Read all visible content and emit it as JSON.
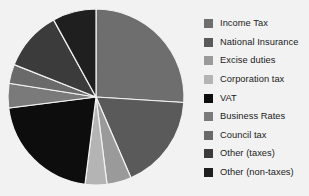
{
  "chart_data": {
    "type": "pie",
    "title": "",
    "subtitle": "",
    "xlabel": "",
    "ylabel": "",
    "grid": false,
    "legend_position": "right",
    "start_angle_deg": 0,
    "direction": "clockwise",
    "background_color": "#f2f2f2",
    "wedge_edge_color": "#f2f2f2",
    "categories": [
      "Income Tax",
      "National Insurance",
      "Excise duties",
      "Corporation tax",
      "VAT",
      "Business Rates",
      "Council tax",
      "Other (taxes)",
      "Other (non-taxes)"
    ],
    "values": [
      26.0,
      17.5,
      4.5,
      4.0,
      21.0,
      4.5,
      3.5,
      11.0,
      8.0
    ],
    "colors": [
      "#6e6e6e",
      "#5a5a5a",
      "#9a9a9a",
      "#b4b4b4",
      "#0d0d0d",
      "#7a7a7a",
      "#6a6a6a",
      "#3b3b3b",
      "#1f1f1f"
    ]
  },
  "legend": {
    "items": [
      {
        "label": "Income Tax",
        "color": "#6e6e6e"
      },
      {
        "label": "National Insurance",
        "color": "#5a5a5a"
      },
      {
        "label": "Excise duties",
        "color": "#9a9a9a"
      },
      {
        "label": "Corporation tax",
        "color": "#b4b4b4"
      },
      {
        "label": "VAT",
        "color": "#0d0d0d"
      },
      {
        "label": "Business Rates",
        "color": "#7a7a7a"
      },
      {
        "label": "Council tax",
        "color": "#6a6a6a"
      },
      {
        "label": "Other (taxes)",
        "color": "#3b3b3b"
      },
      {
        "label": "Other (non-taxes)",
        "color": "#1f1f1f"
      }
    ]
  }
}
